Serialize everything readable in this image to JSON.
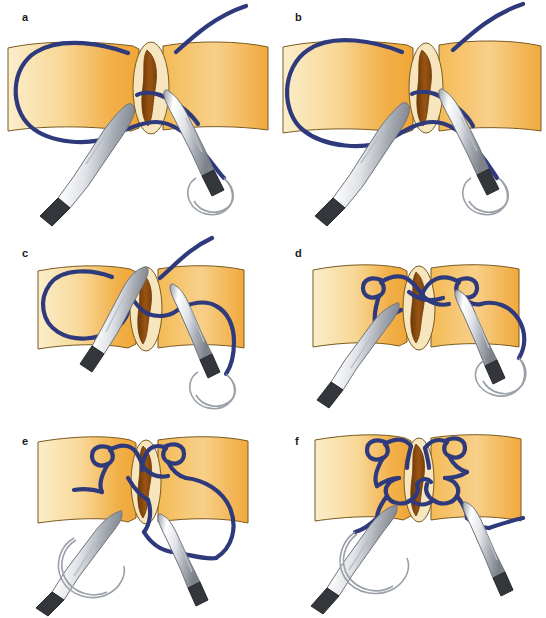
{
  "figure": {
    "panel_count": 6,
    "columns": 2,
    "rows": 3,
    "background_color": "#ffffff"
  },
  "palette": {
    "suture_navy": "#2f3a7c",
    "suture_navy_dark": "#232c63",
    "tissue_light": "#fbeecb",
    "tissue_mid": "#f6c46a",
    "tissue_deep": "#efa637",
    "tissue_outline": "#7a5a20",
    "wound_rim": "#f7e6bd",
    "wound_interior": "#8d4b12",
    "wound_interior_dark": "#6d3908",
    "instrument_light": "#fdfdfd",
    "instrument_mid": "#c9ccd2",
    "instrument_shadow": "#8d929b",
    "instrument_outline": "#6e737c",
    "instrument_tip_dark": "#33373b",
    "needle_stroke": "#9aa0a8",
    "label_color": "#1a1a1a"
  },
  "panels": [
    {
      "id": "a",
      "label": "a",
      "label_x": 22,
      "label_y": 12,
      "origin_x": 0,
      "origin_y": 0,
      "caption": "Suture passed through both tissue edges; long loop of thread lies to the left, needle end held on the right",
      "stage": "suture-placed",
      "instruments": 2,
      "needle_visible": true,
      "knot_formed": false
    },
    {
      "id": "b",
      "label": "b",
      "label_x": 22,
      "label_y": 12,
      "origin_x": 273,
      "origin_y": 0,
      "caption": "Right-hand grasper begins to wrap the free thread around the needle holder",
      "stage": "first-wrap",
      "instruments": 2,
      "needle_visible": true,
      "knot_formed": false
    },
    {
      "id": "c",
      "label": "c",
      "label_x": 22,
      "label_y": 18,
      "origin_x": 0,
      "origin_y": 230,
      "caption": "Instruments rotated over the defect; thread looped across the needle driver shaft",
      "stage": "loop-over-shaft",
      "instruments": 2,
      "needle_visible": true,
      "knot_formed": false
    },
    {
      "id": "d",
      "label": "d",
      "label_x": 22,
      "label_y": 18,
      "origin_x": 273,
      "origin_y": 230,
      "caption": "Free end grasped and pulled through the loop, forming the first throw",
      "stage": "first-throw-pulled",
      "instruments": 2,
      "needle_visible": true,
      "knot_formed": false
    },
    {
      "id": "e",
      "label": "e",
      "label_x": 22,
      "label_y": 16,
      "origin_x": 0,
      "origin_y": 420,
      "caption": "First throw seated on the tissue; ends drawn in opposite directions",
      "stage": "first-throw-seated",
      "instruments": 2,
      "needle_visible": true,
      "knot_formed": true
    },
    {
      "id": "f",
      "label": "f",
      "label_x": 22,
      "label_y": 16,
      "origin_x": 273,
      "origin_y": 420,
      "caption": "Second opposing throw completes a square knot closing the defect",
      "stage": "square-knot-complete",
      "instruments": 2,
      "needle_visible": true,
      "knot_formed": true
    }
  ]
}
